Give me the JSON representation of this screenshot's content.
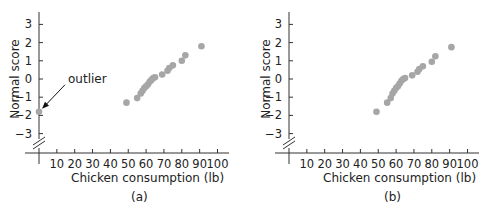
{
  "chart_data": [
    {
      "type": "scatter",
      "panel": "(a)",
      "title": "",
      "xlabel": "Chicken consumption (lb)",
      "ylabel": "Normal score",
      "xlim": [
        0,
        100
      ],
      "ylim": [
        -3.5,
        3.5
      ],
      "xticks": [
        10,
        20,
        30,
        40,
        50,
        60,
        70,
        80,
        90,
        100
      ],
      "yticks": [
        3,
        2,
        1,
        0,
        -1,
        -2,
        -3
      ],
      "ytick_labels": [
        "3",
        "2",
        "1",
        "0",
        "−1",
        "−2",
        "−3"
      ],
      "grid": false,
      "axis_break": "y-axis broken below −3",
      "annotations": [
        {
          "text": "outlier",
          "points_to": [
            0,
            -1.8
          ]
        }
      ],
      "x": [
        0,
        49,
        55,
        57,
        58,
        59,
        60,
        61,
        62,
        63,
        64,
        65,
        69,
        72,
        73,
        75,
        80,
        82,
        91
      ],
      "y": [
        -1.8,
        -1.3,
        -1.05,
        -0.8,
        -0.65,
        -0.5,
        -0.4,
        -0.3,
        -0.15,
        -0.05,
        0.05,
        0.1,
        0.25,
        0.45,
        0.6,
        0.75,
        1.0,
        1.3,
        1.8
      ]
    },
    {
      "type": "scatter",
      "panel": "(b)",
      "title": "",
      "xlabel": "Chicken consumption (lb)",
      "ylabel": "Normal score",
      "xlim": [
        0,
        100
      ],
      "ylim": [
        -3.5,
        3.5
      ],
      "xticks": [
        10,
        20,
        30,
        40,
        50,
        60,
        70,
        80,
        90,
        100
      ],
      "yticks": [
        3,
        2,
        1,
        0,
        -1,
        -2,
        -3
      ],
      "ytick_labels": [
        "3",
        "2",
        "1",
        "0",
        "−1",
        "−2",
        "−3"
      ],
      "grid": false,
      "axis_break": "y-axis broken below −3",
      "annotations": [],
      "x": [
        49,
        55,
        57,
        58,
        59,
        60,
        61,
        62,
        63,
        64,
        65,
        69,
        72,
        73,
        75,
        80,
        82,
        91
      ],
      "y": [
        -1.8,
        -1.3,
        -1.05,
        -0.8,
        -0.65,
        -0.5,
        -0.4,
        -0.25,
        -0.1,
        0.0,
        0.05,
        0.2,
        0.4,
        0.55,
        0.7,
        0.95,
        1.25,
        1.75
      ]
    }
  ],
  "panels": [
    {
      "caption": "(a)",
      "xlabel": "Chicken consumption (lb)",
      "ylabel": "Normal score",
      "annotation": "outlier"
    },
    {
      "caption": "(b)",
      "xlabel": "Chicken consumption (lb)",
      "ylabel": "Normal score",
      "annotation": ""
    }
  ],
  "colors": {
    "point": "#a6a6a6",
    "axis": "#333333",
    "text": "#222222"
  }
}
